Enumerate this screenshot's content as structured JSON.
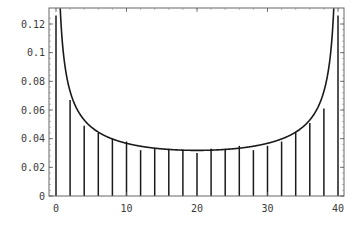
{
  "chart_data": {
    "type": "bar",
    "title": "",
    "xlabel": "",
    "ylabel": "",
    "xlim": [
      -1,
      41
    ],
    "ylim": [
      0,
      0.13
    ],
    "grid": false,
    "legend": null,
    "x_ticks": [
      0,
      10,
      20,
      30,
      40
    ],
    "x_tick_labels": [
      "0",
      "10",
      "20",
      "30",
      "40"
    ],
    "y_ticks": [
      0,
      0.02,
      0.04,
      0.06,
      0.08,
      0.1,
      0.12
    ],
    "y_tick_labels": [
      "0",
      "0.02",
      "0.04",
      "0.06",
      "0.08",
      "0.1",
      "0.12"
    ],
    "series": [
      {
        "name": "probability (stick plot)",
        "style": "vertical-lines",
        "x": [
          0,
          2,
          4,
          6,
          8,
          10,
          12,
          14,
          16,
          18,
          20,
          22,
          24,
          26,
          28,
          30,
          32,
          34,
          36,
          38,
          40
        ],
        "values": [
          0.126,
          0.067,
          0.049,
          0.044,
          0.04,
          0.038,
          0.032,
          0.033,
          0.033,
          0.032,
          0.03,
          0.033,
          0.033,
          0.035,
          0.032,
          0.035,
          0.038,
          0.045,
          0.051,
          0.061,
          0.126
        ]
      },
      {
        "name": "density curve 2/(pi*sqrt(x(40-x)))",
        "style": "line",
        "function": "2/(pi*sqrt(x*(40-x)))",
        "domain": [
          0,
          40
        ]
      }
    ]
  },
  "colors": {
    "line": "#1a1a1a",
    "frame": "#555555",
    "background": "#ffffff"
  }
}
